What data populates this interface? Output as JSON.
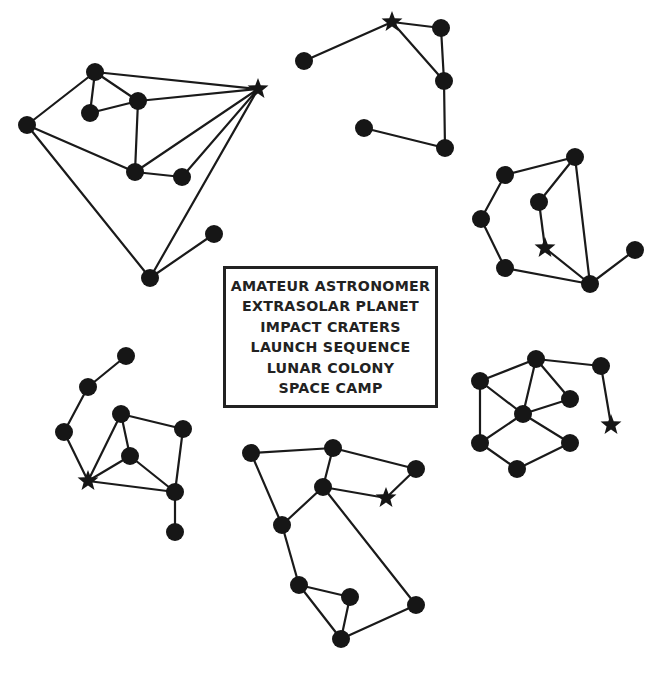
{
  "colors": {
    "ink": "#161616",
    "line": "#1a1a1a",
    "background": "#ffffff"
  },
  "word_list": {
    "words": [
      "AMATEUR ASTRONOMER",
      "EXTRASOLAR PLANET",
      "IMPACT CRATERS",
      "LAUNCH SEQUENCE",
      "LUNAR COLONY",
      "SPACE CAMP"
    ]
  },
  "constellations": [
    {
      "id": "top-left",
      "nodes": [
        [
          95,
          72
        ],
        [
          90,
          113
        ],
        [
          138,
          101
        ],
        [
          27,
          125
        ],
        [
          135,
          172
        ],
        [
          182,
          177
        ],
        [
          214,
          234
        ],
        [
          150,
          278
        ]
      ],
      "star": [
        258,
        89
      ],
      "edges": [
        [
          "n3",
          "n0"
        ],
        [
          "n0",
          "n1"
        ],
        [
          "n0",
          "n2"
        ],
        [
          "n0",
          "s"
        ],
        [
          "n1",
          "n2"
        ],
        [
          "n2",
          "s"
        ],
        [
          "n2",
          "n4"
        ],
        [
          "n3",
          "n4"
        ],
        [
          "n4",
          "n5"
        ],
        [
          "n4",
          "s"
        ],
        [
          "n5",
          "s"
        ],
        [
          "n3",
          "n7"
        ],
        [
          "n7",
          "s"
        ],
        [
          "n7",
          "n6"
        ]
      ]
    },
    {
      "id": "top-center",
      "nodes": [
        [
          304,
          61
        ],
        [
          441,
          28
        ],
        [
          444,
          81
        ],
        [
          364,
          128
        ],
        [
          445,
          148
        ]
      ],
      "star": [
        392,
        22
      ],
      "edges": [
        [
          "n0",
          "s"
        ],
        [
          "s",
          "n1"
        ],
        [
          "s",
          "n2"
        ],
        [
          "n1",
          "n2"
        ],
        [
          "n2",
          "n4"
        ],
        [
          "n3",
          "n4"
        ]
      ]
    },
    {
      "id": "right-upper",
      "nodes": [
        [
          575,
          157
        ],
        [
          505,
          175
        ],
        [
          539,
          202
        ],
        [
          481,
          219
        ],
        [
          505,
          268
        ],
        [
          590,
          284
        ],
        [
          635,
          250
        ]
      ],
      "star": [
        545,
        248
      ],
      "edges": [
        [
          "n1",
          "n0"
        ],
        [
          "n0",
          "n2"
        ],
        [
          "n0",
          "n5"
        ],
        [
          "n1",
          "n3"
        ],
        [
          "n3",
          "n4"
        ],
        [
          "n4",
          "n5"
        ],
        [
          "n2",
          "s"
        ],
        [
          "s",
          "n5"
        ],
        [
          "n5",
          "n6"
        ]
      ]
    },
    {
      "id": "right-lower",
      "nodes": [
        [
          536,
          359
        ],
        [
          601,
          366
        ],
        [
          480,
          381
        ],
        [
          570,
          399
        ],
        [
          523,
          414
        ],
        [
          480,
          443
        ],
        [
          570,
          443
        ],
        [
          517,
          469
        ]
      ],
      "star": [
        611,
        425
      ],
      "edges": [
        [
          "n2",
          "n0"
        ],
        [
          "n0",
          "n1"
        ],
        [
          "n0",
          "n4"
        ],
        [
          "n0",
          "n3"
        ],
        [
          "n3",
          "n4"
        ],
        [
          "n2",
          "n4"
        ],
        [
          "n2",
          "n5"
        ],
        [
          "n4",
          "n5"
        ],
        [
          "n4",
          "n6"
        ],
        [
          "n5",
          "n7"
        ],
        [
          "n7",
          "n6"
        ],
        [
          "n1",
          "s"
        ]
      ]
    },
    {
      "id": "left-lower",
      "nodes": [
        [
          126,
          356
        ],
        [
          88,
          387
        ],
        [
          64,
          432
        ],
        [
          121,
          414
        ],
        [
          183,
          429
        ],
        [
          130,
          456
        ],
        [
          175,
          492
        ],
        [
          175,
          532
        ]
      ],
      "star": [
        88,
        481
      ],
      "edges": [
        [
          "n0",
          "n1"
        ],
        [
          "n1",
          "n2"
        ],
        [
          "n2",
          "s"
        ],
        [
          "s",
          "n3"
        ],
        [
          "n3",
          "n4"
        ],
        [
          "n3",
          "n5"
        ],
        [
          "n5",
          "s"
        ],
        [
          "n5",
          "n6"
        ],
        [
          "n4",
          "n6"
        ],
        [
          "s",
          "n6"
        ],
        [
          "n6",
          "n7"
        ]
      ]
    },
    {
      "id": "bottom-center",
      "nodes": [
        [
          251,
          453
        ],
        [
          333,
          448
        ],
        [
          416,
          469
        ],
        [
          323,
          487
        ],
        [
          282,
          525
        ],
        [
          299,
          585
        ],
        [
          350,
          597
        ],
        [
          416,
          605
        ],
        [
          341,
          639
        ]
      ],
      "star": [
        386,
        498
      ],
      "edges": [
        [
          "n0",
          "n1"
        ],
        [
          "n1",
          "n2"
        ],
        [
          "n1",
          "n3"
        ],
        [
          "n2",
          "s"
        ],
        [
          "n3",
          "s"
        ],
        [
          "n3",
          "n4"
        ],
        [
          "n0",
          "n4"
        ],
        [
          "n4",
          "n5"
        ],
        [
          "n5",
          "n6"
        ],
        [
          "n5",
          "n8"
        ],
        [
          "n6",
          "n8"
        ],
        [
          "n3",
          "n7"
        ],
        [
          "n7",
          "n8"
        ]
      ]
    }
  ],
  "node_radius": 9,
  "star_radius": 11
}
